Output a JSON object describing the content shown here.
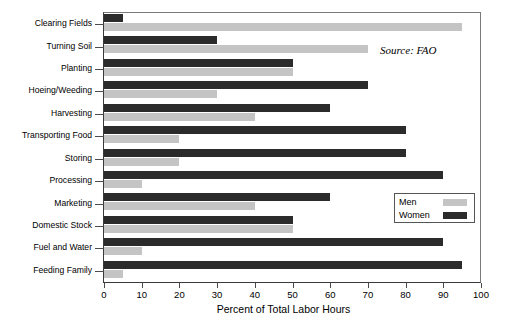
{
  "chart_data": {
    "type": "bar",
    "orientation": "horizontal",
    "title": "",
    "xlabel": "Percent of Total Labor Hours",
    "ylabel": "",
    "xlim": [
      0,
      100
    ],
    "xticks": [
      0,
      10,
      20,
      30,
      40,
      50,
      60,
      70,
      80,
      90,
      100
    ],
    "grid": false,
    "legend_position": "inside-right",
    "annotation": "Source: FAO",
    "categories": [
      "Clearing Fields",
      "Turning Soil",
      "Planting",
      "Hoeing/Weeding",
      "Harvesting",
      "Transporting Food",
      "Storing",
      "Processing",
      "Marketing",
      "Domestic Stock",
      "Fuel and Water",
      "Feeding Family"
    ],
    "series": [
      {
        "name": "Men",
        "color": "#c4c4c4",
        "values": [
          95,
          70,
          50,
          30,
          40,
          20,
          20,
          10,
          40,
          50,
          10,
          5
        ]
      },
      {
        "name": "Women",
        "color": "#2b2b2b",
        "values": [
          5,
          30,
          50,
          70,
          60,
          80,
          80,
          90,
          60,
          50,
          90,
          95
        ]
      }
    ]
  },
  "legend": {
    "items": [
      {
        "label": "Men",
        "color": "#c4c4c4"
      },
      {
        "label": "Women",
        "color": "#2b2b2b"
      }
    ]
  }
}
